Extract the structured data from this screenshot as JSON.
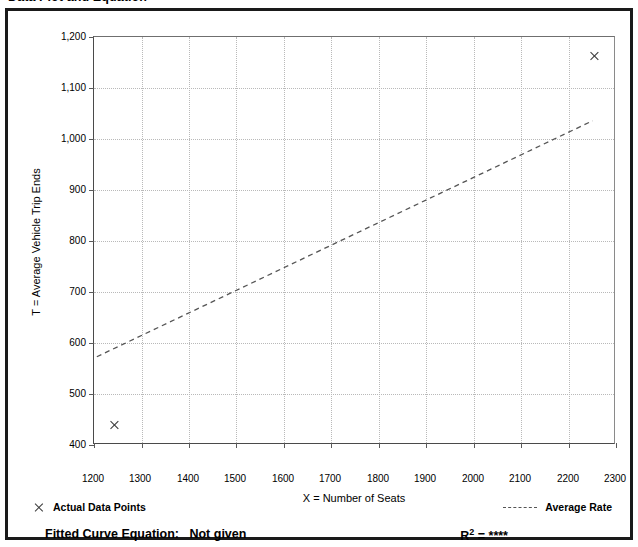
{
  "header": {
    "title": "Data Plot and Equation"
  },
  "chart_data": {
    "type": "scatter",
    "title": "",
    "xlabel": "X = Number of Seats",
    "ylabel": "T = Average Vehicle Trip Ends",
    "xlim": [
      1200,
      2300
    ],
    "ylim": [
      400,
      1200
    ],
    "xticks": [
      1200,
      1300,
      1400,
      1500,
      1600,
      1700,
      1800,
      1900,
      2000,
      2100,
      2200,
      2300
    ],
    "xticklabels": [
      "1200",
      "1300",
      "1400",
      "1500",
      "1600",
      "1700",
      "1800",
      "1900",
      "2000",
      "2100",
      "2200",
      "2300"
    ],
    "yticks": [
      400,
      500,
      600,
      700,
      800,
      900,
      1000,
      1100,
      1200
    ],
    "yticklabels": [
      "400",
      "500",
      "600",
      "700",
      "800",
      "900",
      "1,000",
      "1,100",
      "1,200"
    ],
    "grid": true,
    "legend_position": "below-axes",
    "series": [
      {
        "name": "Actual Data Points",
        "type": "scatter",
        "marker": "x",
        "color": "#3a3a3a",
        "points": [
          {
            "x": 1243,
            "y": 440
          },
          {
            "x": 2255,
            "y": 1163
          }
        ]
      },
      {
        "name": "Average Rate",
        "type": "line",
        "style": "dashed",
        "color": "#555555",
        "points": [
          {
            "x": 1206,
            "y": 570
          },
          {
            "x": 2255,
            "y": 1035
          }
        ]
      }
    ]
  },
  "legend": {
    "actual_label": "Actual Data Points",
    "average_label": "Average Rate",
    "marker_icon": "x-marker-icon",
    "line_icon": "dashed-line-icon"
  },
  "equation": {
    "fitted_label": "Fitted Curve Equation:",
    "fitted_value": "Not given",
    "r2_label": "R",
    "r2_exponent": "2",
    "r2_equals": "=",
    "r2_value": "****"
  },
  "colors": {
    "frame": "#1a1a1a",
    "grid": "#b9b9b9",
    "axis": "#4a4a4a",
    "marker": "#3a3a3a",
    "trend": "#555555"
  }
}
